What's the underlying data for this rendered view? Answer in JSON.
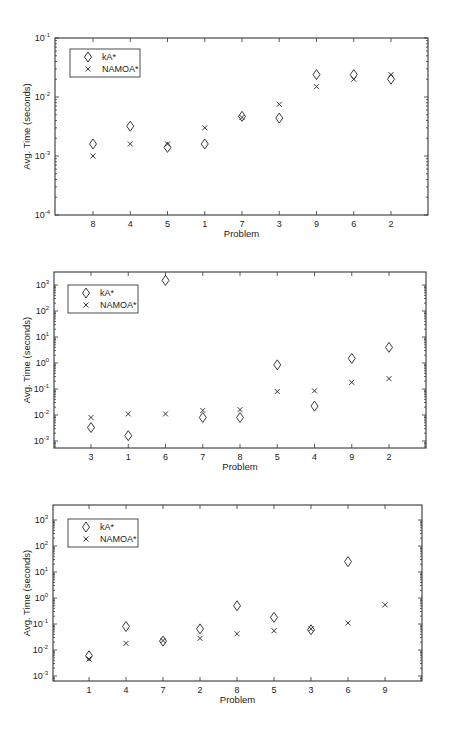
{
  "chart_data": [
    {
      "type": "scatter",
      "title": "",
      "xlabel": "Problem",
      "ylabel": "Avg. Time (seconds)",
      "yscale": "log",
      "ylim": [
        0.0001,
        0.1
      ],
      "ytick_exponents": [
        -4,
        -3,
        -2,
        -1
      ],
      "categories": [
        "8",
        "4",
        "5",
        "1",
        "7",
        "3",
        "9",
        "6",
        "2"
      ],
      "series": [
        {
          "name": "kA*",
          "marker": "diamond",
          "values": [
            0.0016,
            0.0032,
            0.0014,
            0.0016,
            0.0047,
            0.0044,
            0.024,
            0.024,
            0.02
          ]
        },
        {
          "name": "NAMOA*",
          "marker": "x",
          "values": [
            0.001,
            0.0016,
            0.0016,
            0.003,
            0.0045,
            0.0075,
            0.015,
            0.02,
            0.024
          ]
        }
      ],
      "legend_position": "upper left",
      "grid": false
    },
    {
      "type": "scatter",
      "title": "",
      "xlabel": "Problem",
      "ylabel": "Avg. Time (seconds)",
      "yscale": "log",
      "ylim": [
        0.0005,
        3000
      ],
      "ytick_exponents": [
        -3,
        -2,
        -1,
        0,
        1,
        2,
        3
      ],
      "categories": [
        "3",
        "1",
        "6",
        "7",
        "8",
        "5",
        "4",
        "9",
        "2"
      ],
      "series": [
        {
          "name": "kA*",
          "marker": "diamond",
          "values": [
            0.0033,
            0.0016,
            1500,
            0.008,
            0.008,
            0.85,
            0.022,
            1.5,
            4.0
          ]
        },
        {
          "name": "NAMOA*",
          "marker": "x",
          "values": [
            0.008,
            0.011,
            0.011,
            0.015,
            0.016,
            0.08,
            0.085,
            0.18,
            0.25
          ]
        }
      ],
      "legend_position": "upper left",
      "grid": false
    },
    {
      "type": "scatter",
      "title": "",
      "xlabel": "Problem",
      "ylabel": "Avg. Time (seconds)",
      "yscale": "log",
      "ylim": [
        0.0005,
        3000
      ],
      "ytick_exponents": [
        -3,
        -2,
        -1,
        0,
        1,
        2,
        3
      ],
      "categories": [
        "1",
        "4",
        "7",
        "2",
        "8",
        "5",
        "3",
        "6",
        "9"
      ],
      "series": [
        {
          "name": "kA*",
          "marker": "diamond",
          "values": [
            0.006,
            0.08,
            0.022,
            0.065,
            0.5,
            0.18,
            0.06,
            25,
            null
          ]
        },
        {
          "name": "NAMOA*",
          "marker": "x",
          "values": [
            0.0045,
            0.018,
            0.023,
            0.028,
            0.042,
            0.055,
            0.065,
            0.11,
            0.55
          ]
        }
      ],
      "legend_position": "upper left",
      "grid": false
    }
  ],
  "legend": {
    "kA": "kA*",
    "namoa": "NAMOA*"
  },
  "axis": {
    "xlabel": "Problem",
    "ylabel": "Avg. Time (seconds)"
  }
}
